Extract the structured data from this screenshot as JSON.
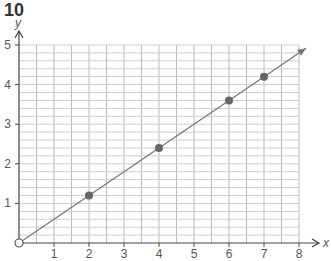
{
  "question_number": "10",
  "chart_data": {
    "type": "line",
    "title": "",
    "xlabel": "x",
    "ylabel": "y",
    "xlim": [
      0,
      8
    ],
    "ylim": [
      0,
      5
    ],
    "x_ticks": [
      "1",
      "2",
      "3",
      "4",
      "5",
      "6",
      "7",
      "8"
    ],
    "y_ticks": [
      "1",
      "2",
      "3",
      "4",
      "5"
    ],
    "grid": true,
    "series": [
      {
        "name": "line through origin",
        "x": [
          0,
          8.2
        ],
        "y": [
          0,
          4.92
        ]
      },
      {
        "name": "points",
        "x": [
          2,
          4,
          6,
          7
        ],
        "y": [
          1.2,
          2.4,
          3.6,
          4.2
        ]
      }
    ],
    "origin_marker": "open circle at (0,0)"
  }
}
